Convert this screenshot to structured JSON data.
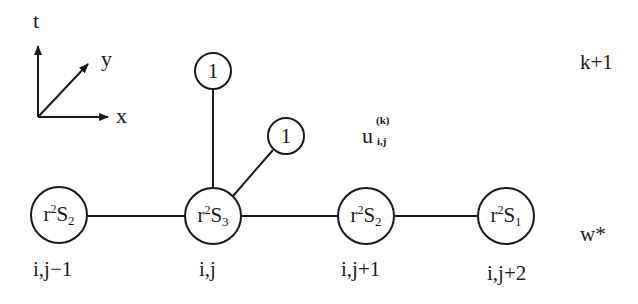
{
  "diagram": {
    "type": "finite-difference stencil",
    "stroke_color": "#1a1a1a",
    "background": "#ffffff",
    "axes": {
      "t_label": "t",
      "x_label": "x",
      "y_label": "y"
    },
    "level_labels": {
      "upper": "k+1",
      "lower": "w*"
    },
    "center_value_label": {
      "base": "u",
      "superscript": "(k)",
      "subscript": "i,j"
    },
    "nodes": [
      {
        "id": "n-i-jm1",
        "coef": "r",
        "coef_power": "2",
        "symbol": "S",
        "symbol_index": "2",
        "index_label": "i,j−1"
      },
      {
        "id": "n-i-j",
        "coef": "r",
        "coef_power": "2",
        "symbol": "S",
        "symbol_index": "3",
        "index_label": "i,j"
      },
      {
        "id": "n-i-jp1",
        "coef": "r",
        "coef_power": "2",
        "symbol": "S",
        "symbol_index": "2",
        "index_label": "i,j+1"
      },
      {
        "id": "n-i-jp2",
        "coef": "r",
        "coef_power": "2",
        "symbol": "S",
        "symbol_index": "1",
        "index_label": "i,j+2"
      }
    ],
    "upper_nodes": [
      {
        "id": "up-vertical",
        "value": "1"
      },
      {
        "id": "up-diagonal",
        "value": "1"
      }
    ]
  }
}
